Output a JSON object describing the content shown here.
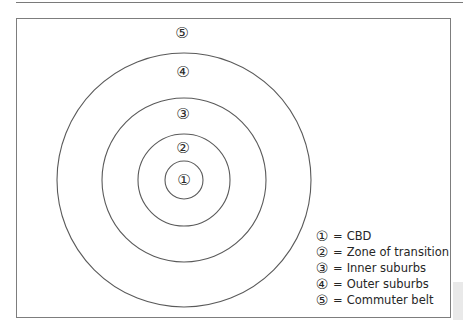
{
  "diagram": {
    "type": "concentric-zone-model",
    "center": {
      "x": 184,
      "y": 180
    },
    "stroke_color": "#5a5a5a",
    "rings": [
      {
        "id": 1,
        "radius": 19,
        "label": "①",
        "label_pos": {
          "x": 184,
          "y": 180
        }
      },
      {
        "id": 2,
        "radius": 46,
        "label": "②",
        "label_pos": {
          "x": 183,
          "y": 148
        }
      },
      {
        "id": 3,
        "radius": 82,
        "label": "③",
        "label_pos": {
          "x": 183,
          "y": 114
        }
      },
      {
        "id": 4,
        "radius": 127,
        "label": "④",
        "label_pos": {
          "x": 183,
          "y": 72
        }
      },
      {
        "id": 5,
        "radius": null,
        "label": "⑤",
        "label_pos": {
          "x": 182,
          "y": 33
        }
      }
    ]
  },
  "legend": {
    "items": [
      {
        "num": "①",
        "eq": "=",
        "text": "CBD"
      },
      {
        "num": "②",
        "eq": "=",
        "text": "Zone of transition"
      },
      {
        "num": "③",
        "eq": "=",
        "text": "Inner suburbs"
      },
      {
        "num": "④",
        "eq": "=",
        "text": "Outer suburbs"
      },
      {
        "num": "⑤",
        "eq": "=",
        "text": "Commuter belt"
      }
    ]
  }
}
